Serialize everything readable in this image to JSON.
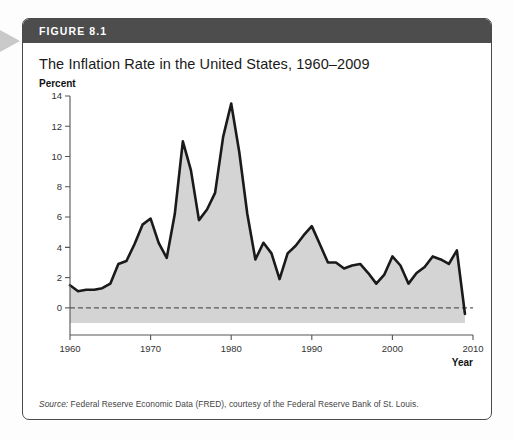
{
  "figure": {
    "banner_label": "FIGURE 8.1",
    "title": "The Inflation Rate in the United States, 1960–2009",
    "source_lead": "Source:",
    "source_text": " Federal Reserve Economic Data (FRED), courtesy of the Federal Reserve Bank of St. Louis.",
    "banner_color": "#4d4d4d",
    "border_color": "#4a4a4a",
    "edge_arrow_color": "#c9c9c9"
  },
  "chart_data": {
    "type": "area",
    "title": "The Inflation Rate in the United States, 1960–2009",
    "xlabel": "Year",
    "ylabel": "Percent",
    "xlim": [
      1960,
      2010
    ],
    "ylim": [
      -1,
      14
    ],
    "ytick_values": [
      0,
      2,
      4,
      6,
      8,
      10,
      12,
      14
    ],
    "ytick_labels": [
      "0",
      "2",
      "4",
      "6",
      "8",
      "10",
      "12",
      "14"
    ],
    "xtick_values": [
      1960,
      1970,
      1980,
      1990,
      2000,
      2010
    ],
    "xtick_labels": [
      "1960",
      "1970",
      "1980",
      "1990",
      "2000",
      "2010"
    ],
    "grid": false,
    "legend": false,
    "zero_line": 0,
    "zero_line_style": "dashed",
    "line_color": "#1a1a1a",
    "fill_color": "#d4d4d4",
    "x": [
      1960,
      1961,
      1962,
      1963,
      1964,
      1965,
      1966,
      1967,
      1968,
      1969,
      1970,
      1971,
      1972,
      1973,
      1974,
      1975,
      1976,
      1977,
      1978,
      1979,
      1980,
      1981,
      1982,
      1983,
      1984,
      1985,
      1986,
      1987,
      1988,
      1989,
      1990,
      1991,
      1992,
      1993,
      1994,
      1995,
      1996,
      1997,
      1998,
      1999,
      2000,
      2001,
      2002,
      2003,
      2004,
      2005,
      2006,
      2007,
      2008,
      2009
    ],
    "values": [
      1.5,
      1.1,
      1.2,
      1.2,
      1.3,
      1.6,
      2.9,
      3.1,
      4.2,
      5.5,
      5.9,
      4.3,
      3.3,
      6.2,
      11.0,
      9.1,
      5.8,
      6.5,
      7.6,
      11.3,
      13.5,
      10.3,
      6.2,
      3.2,
      4.3,
      3.6,
      1.9,
      3.6,
      4.1,
      4.8,
      5.4,
      4.2,
      3.0,
      3.0,
      2.6,
      2.8,
      2.9,
      2.3,
      1.6,
      2.2,
      3.4,
      2.8,
      1.6,
      2.3,
      2.7,
      3.4,
      3.2,
      2.9,
      3.8,
      -0.4
    ],
    "series_name": "Inflation rate (percent)"
  }
}
